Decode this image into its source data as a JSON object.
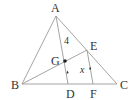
{
  "diagram": {
    "type": "geometry",
    "colors": {
      "line": "#9a9a9a",
      "text": "#333333",
      "point": "#222222"
    },
    "points": {
      "A": {
        "label": "A",
        "x": 56,
        "y": 16
      },
      "B": {
        "label": "B",
        "x": 22,
        "y": 84
      },
      "C": {
        "label": "C",
        "x": 117,
        "y": 84
      },
      "D": {
        "label": "D",
        "x": 68,
        "y": 84
      },
      "E": {
        "label": "E",
        "x": 87,
        "y": 50
      },
      "F": {
        "label": "F",
        "x": 93,
        "y": 84
      },
      "G": {
        "label": "G",
        "x": 65,
        "y": 61
      }
    },
    "segments": [
      [
        "A",
        "B"
      ],
      [
        "A",
        "C"
      ],
      [
        "B",
        "C"
      ],
      [
        "A",
        "D"
      ],
      [
        "B",
        "E"
      ],
      [
        "E",
        "F"
      ]
    ],
    "measurements": {
      "AG": "4",
      "EF": "x"
    },
    "parallel_marks": [
      "AD",
      "EF"
    ]
  }
}
